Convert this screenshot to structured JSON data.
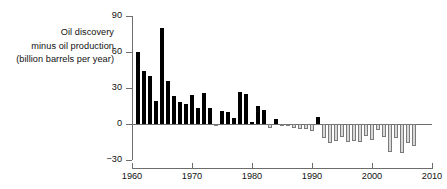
{
  "chart_data": {
    "type": "bar",
    "title": "",
    "subtitle": "",
    "ylabel_lines": [
      "Oil discovery",
      "minus oil production",
      "(billion barrels per year)"
    ],
    "ylabel": "Oil discovery minus oil production (billion barrels per year)",
    "xlabel": "",
    "ylim": [
      -30,
      90
    ],
    "xlim": [
      1960,
      2010
    ],
    "ytick_labels": [
      "90",
      "60",
      "30",
      "0",
      "−30"
    ],
    "ytick_values": [
      90,
      60,
      30,
      0,
      -30
    ],
    "xtick_labels": [
      "1960",
      "1970",
      "1980",
      "1990",
      "2000",
      "2010"
    ],
    "xtick_values": [
      1960,
      1970,
      1980,
      1990,
      2000,
      2010
    ],
    "grid": false,
    "legend": null,
    "colors": {
      "positive_bar": "#000000",
      "negative_bar_fill": "#d9d9d9",
      "negative_bar_edge": "#7a7a7a",
      "axis": "#6d6d6d",
      "text": "#111111",
      "background": "#ffffff"
    },
    "x": [
      1961,
      1962,
      1963,
      1964,
      1965,
      1966,
      1967,
      1968,
      1969,
      1970,
      1971,
      1972,
      1973,
      1974,
      1975,
      1976,
      1977,
      1978,
      1979,
      1980,
      1981,
      1982,
      1983,
      1984,
      1985,
      1986,
      1987,
      1988,
      1989,
      1990,
      1991,
      1992,
      1993,
      1994,
      1995,
      1996,
      1997,
      1998,
      1999,
      2000,
      2001,
      2002,
      2003,
      2004,
      2005,
      2006,
      2007
    ],
    "values": [
      60,
      44,
      40,
      19,
      80,
      36,
      23,
      18,
      17,
      24,
      13,
      26,
      13,
      -1,
      11,
      10,
      5,
      27,
      25,
      2,
      15,
      12,
      -3,
      4,
      -2,
      -1,
      -3,
      -4,
      -4,
      -6,
      6,
      -12,
      -16,
      -14,
      -11,
      -15,
      -14,
      -15,
      -10,
      -13,
      -5,
      -11,
      -23,
      -12,
      -24,
      -16,
      -18
    ],
    "bar_width_years": 0.8
  }
}
